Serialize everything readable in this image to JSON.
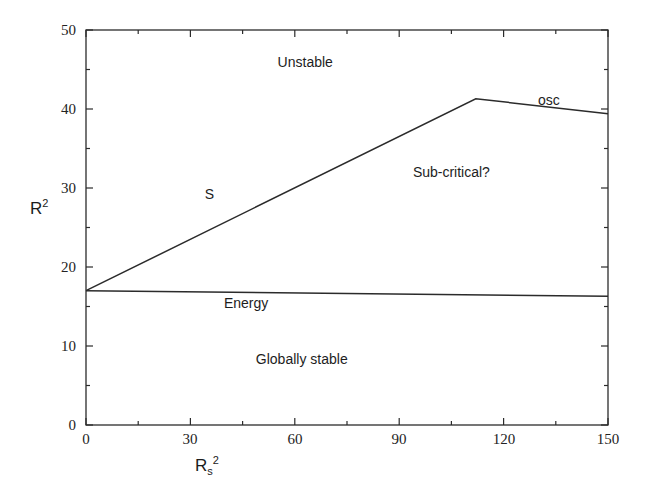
{
  "chart_data": {
    "type": "line",
    "title": "",
    "xlabel": "R_s^2",
    "ylabel": "R^2",
    "xlim": [
      0,
      150
    ],
    "ylim": [
      0,
      50
    ],
    "grid": false,
    "legend_position": "none",
    "x_ticks": [
      0,
      30,
      60,
      90,
      120,
      150
    ],
    "x_tick_labels": [
      "0",
      "30",
      "60",
      "90",
      "120",
      "150"
    ],
    "x_minor_ticks": [
      15,
      45,
      75,
      105,
      135
    ],
    "y_ticks": [
      0,
      10,
      20,
      30,
      40,
      50
    ],
    "y_tick_labels": [
      "0",
      "10",
      "20",
      "30",
      "40",
      "50"
    ],
    "y_minor_ticks": [
      5,
      15,
      25,
      35,
      45
    ],
    "series": [
      {
        "name": "S",
        "points": [
          [
            0,
            17.0
          ],
          [
            112,
            41.3
          ],
          [
            150,
            39.4
          ]
        ]
      },
      {
        "name": "Energy",
        "points": [
          [
            0,
            17.0
          ],
          [
            150,
            16.3
          ]
        ]
      }
    ],
    "annotations": [
      {
        "text": "Unstable",
        "x": 63,
        "y": 46.0
      },
      {
        "text": "osc",
        "x": 133,
        "y": 41.2
      },
      {
        "text": "Sub-critical?",
        "x": 105,
        "y": 32.0
      },
      {
        "text": "S",
        "x": 35.5,
        "y": 29.2
      },
      {
        "text": "Energy",
        "x": 46,
        "y": 15.5
      },
      {
        "text": "Globally stable",
        "x": 62,
        "y": 8.4
      }
    ]
  },
  "axes": {
    "y_title_main": "R",
    "y_title_sup": "2",
    "x_title_main": "R",
    "x_title_sub": "s",
    "x_title_sup": "2"
  },
  "colors": {
    "line": "#2b2b2b",
    "axis": "#2b2b2b",
    "text": "#1d1d1d",
    "background": "#ffffff"
  }
}
